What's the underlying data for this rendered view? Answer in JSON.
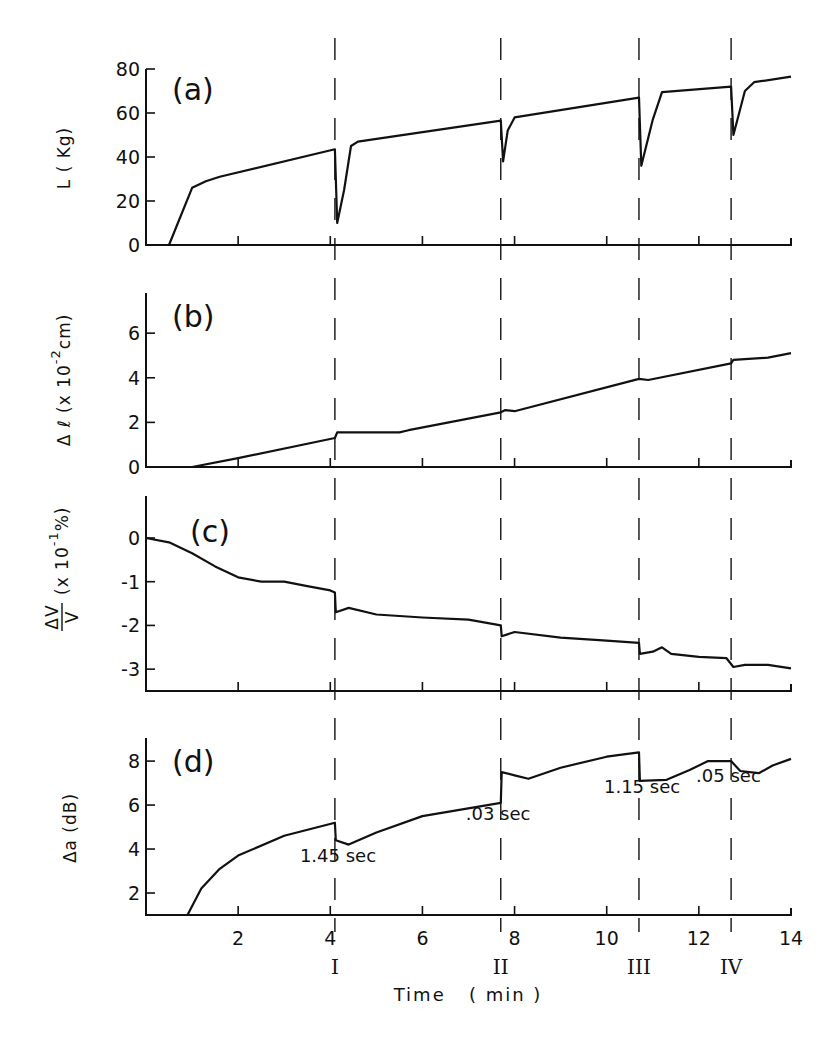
{
  "chart_data": [
    {
      "panel": "(a)",
      "type": "line",
      "ylabel": "L ( Kg)",
      "xlabel": "Time (min)",
      "ylim": [
        0,
        80
      ],
      "yticks": [
        0,
        20,
        40,
        60,
        80
      ],
      "x": [
        0.5,
        1.0,
        1.3,
        1.6,
        4.1,
        4.15,
        4.3,
        4.45,
        4.6,
        7.7,
        7.75,
        7.85,
        8.0,
        10.7,
        10.75,
        11.0,
        11.2,
        12.7,
        12.75,
        13.0,
        13.2,
        14.0
      ],
      "values": [
        0,
        26,
        29,
        31,
        43.5,
        10,
        25,
        45,
        47,
        56.5,
        38,
        52,
        58,
        67,
        36,
        57,
        69.5,
        72,
        50,
        70,
        74,
        76.5
      ]
    },
    {
      "panel": "(b)",
      "type": "line",
      "ylabel": "Δℓ (x 10⁻² cm)",
      "xlabel": "Time (min)",
      "ylim": [
        0,
        7.8
      ],
      "yticks": [
        0,
        2,
        4,
        6
      ],
      "x": [
        0,
        1.0,
        2.0,
        4.1,
        4.15,
        5.5,
        5.7,
        7.7,
        7.8,
        8.0,
        10.7,
        10.9,
        12.7,
        12.75,
        13.5,
        14.0
      ],
      "values": [
        0,
        0,
        0.4,
        1.3,
        1.55,
        1.55,
        1.65,
        2.45,
        2.55,
        2.5,
        3.95,
        3.9,
        4.65,
        4.8,
        4.9,
        5.1
      ]
    },
    {
      "panel": "(c)",
      "type": "line",
      "ylabel": "ΔV/V (x 10⁻¹ %)",
      "xlabel": "Time (min)",
      "ylim": [
        -3.5,
        1.0
      ],
      "yticks": [
        0,
        -1,
        -2,
        -3
      ],
      "x": [
        0,
        0.5,
        1.0,
        1.5,
        2.0,
        2.5,
        3.0,
        3.5,
        4.0,
        4.1,
        4.12,
        4.4,
        5.0,
        6.0,
        7.0,
        7.7,
        7.72,
        8.0,
        9.0,
        10.0,
        10.7,
        10.72,
        11.0,
        11.2,
        11.4,
        12.0,
        12.6,
        12.75,
        13.0,
        13.5,
        14.0
      ],
      "values": [
        0,
        -0.1,
        -0.35,
        -0.65,
        -0.9,
        -1.0,
        -1.0,
        -1.1,
        -1.2,
        -1.25,
        -1.7,
        -1.6,
        -1.75,
        -1.82,
        -1.87,
        -2.0,
        -2.25,
        -2.15,
        -2.28,
        -2.35,
        -2.4,
        -2.65,
        -2.6,
        -2.5,
        -2.65,
        -2.72,
        -2.75,
        -2.95,
        -2.9,
        -2.9,
        -2.98
      ]
    },
    {
      "panel": "(d)",
      "type": "line",
      "ylabel": "Δa (dB)",
      "xlabel": "Time (min)",
      "ylim": [
        1,
        9
      ],
      "yticks": [
        2,
        4,
        6,
        8
      ],
      "x": [
        0.9,
        1.2,
        1.6,
        2.0,
        3.0,
        4.1,
        4.12,
        4.4,
        5.0,
        6.0,
        7.7,
        7.72,
        8.0,
        8.3,
        9.0,
        10.0,
        10.7,
        10.72,
        11.3,
        11.8,
        12.2,
        12.7,
        12.9,
        13.3,
        13.6,
        14.0
      ],
      "values": [
        1,
        2.2,
        3.1,
        3.7,
        4.6,
        5.2,
        4.4,
        4.2,
        4.75,
        5.5,
        6.1,
        7.5,
        7.35,
        7.2,
        7.7,
        8.2,
        8.4,
        7.1,
        7.15,
        7.6,
        8.0,
        8.0,
        7.55,
        7.45,
        7.8,
        8.1
      ],
      "annotations": [
        {
          "text": "1.45 sec",
          "x": 4.1,
          "y": 3.7
        },
        {
          "text": ".03 sec",
          "x": 7.7,
          "y": 5.6
        },
        {
          "text": "1.15 sec",
          "x": 10.7,
          "y": 6.8
        },
        {
          "text": ".05 sec",
          "x": 12.7,
          "y": 7.3
        }
      ]
    }
  ],
  "x_axis": {
    "label": "Time   ( min )",
    "xlim": [
      0,
      14
    ],
    "ticks": [
      2,
      4,
      6,
      8,
      10,
      12,
      14
    ],
    "tick_labels": [
      "2",
      "4",
      "6",
      "8",
      "10",
      "12",
      "14"
    ]
  },
  "events": [
    {
      "label": "I",
      "t": 4.1
    },
    {
      "label": "II",
      "t": 7.7
    },
    {
      "label": "III",
      "t": 10.7
    },
    {
      "label": "IV",
      "t": 12.7
    }
  ],
  "panels": {
    "a": {
      "tag": "(a)",
      "ylabel": "L ( Kg)",
      "yticklabels": [
        "0",
        "20",
        "40",
        "60",
        "80"
      ]
    },
    "b": {
      "tag": "(b)",
      "ylabel_main": "Δ ℓ (x 10",
      "ylabel_sup": "-2",
      "ylabel_end": "cm)",
      "yticklabels": [
        "0",
        "2",
        "4",
        "6"
      ]
    },
    "c": {
      "tag": "(c)",
      "ylabel_num": "ΔV",
      "ylabel_den": "V",
      "ylabel_main": "(x 10",
      "ylabel_sup": "-1",
      "ylabel_end": "%)",
      "yticklabels": [
        "0",
        "-1",
        "-2",
        "-3"
      ]
    },
    "d": {
      "tag": "(d)",
      "ylabel": "Δa (dB)",
      "yticklabels": [
        "2",
        "4",
        "6",
        "8"
      ]
    }
  }
}
